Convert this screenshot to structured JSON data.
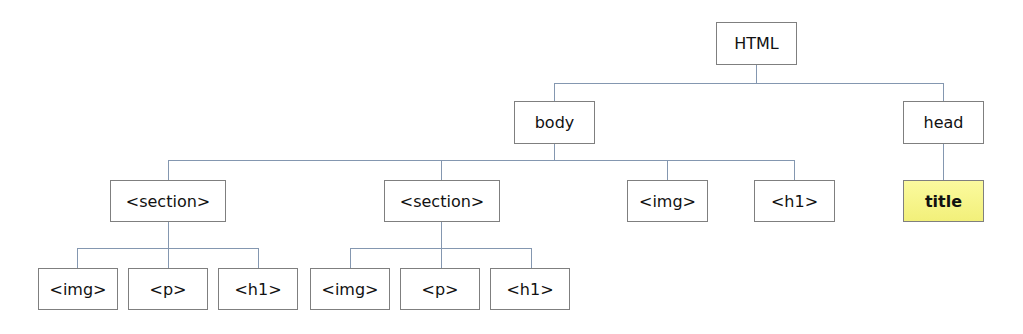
{
  "diagram": {
    "type": "tree",
    "colors": {
      "box_border": "#7f7f7f",
      "connector": "#8497b0",
      "highlight_fill": "#f5f38a"
    },
    "nodes": {
      "html": "HTML",
      "body": "body",
      "head": "head",
      "title": "title",
      "body_section_1": "<section>",
      "body_section_2": "<section>",
      "body_img": "<img>",
      "body_h1": "<h1>",
      "s1_img": "<img>",
      "s1_p": "<p>",
      "s1_h1": "<h1>",
      "s2_img": "<img>",
      "s2_p": "<p>",
      "s2_h1": "<h1>"
    },
    "edges": [
      [
        "html",
        "body"
      ],
      [
        "html",
        "head"
      ],
      [
        "head",
        "title"
      ],
      [
        "body",
        "body_section_1"
      ],
      [
        "body",
        "body_section_2"
      ],
      [
        "body",
        "body_img"
      ],
      [
        "body",
        "body_h1"
      ],
      [
        "body_section_1",
        "s1_img"
      ],
      [
        "body_section_1",
        "s1_p"
      ],
      [
        "body_section_1",
        "s1_h1"
      ],
      [
        "body_section_2",
        "s2_img"
      ],
      [
        "body_section_2",
        "s2_p"
      ],
      [
        "body_section_2",
        "s2_h1"
      ]
    ],
    "highlighted": [
      "title"
    ]
  }
}
